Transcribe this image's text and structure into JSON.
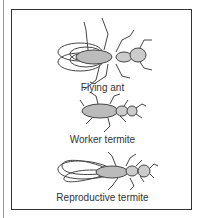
{
  "figure": {
    "items": [
      {
        "label": "Flying ant",
        "icon": "flying-ant"
      },
      {
        "label": "Worker termite",
        "icon": "worker-termite"
      },
      {
        "label": "Reproductive termite",
        "icon": "reproductive-termite"
      }
    ]
  }
}
